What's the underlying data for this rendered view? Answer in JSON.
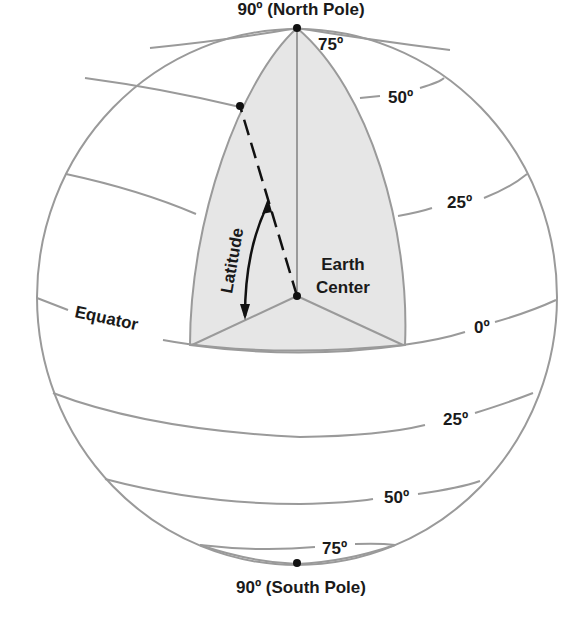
{
  "diagram": {
    "title_top": "90º (North Pole)",
    "title_bottom": "90º (South Pole)",
    "center_label_line1": "Earth",
    "center_label_line2": "Center",
    "angle_label": "Latitude",
    "equator_label": "Equator",
    "northern_latitudes": [
      "75º",
      "50º",
      "25º"
    ],
    "equator_degree": "0º",
    "southern_latitudes": [
      "25º",
      "50º",
      "75º"
    ],
    "colors": {
      "lines": "#9a9a9a",
      "wedge_fill": "#e6e6e6",
      "text": "#1a1a1a"
    }
  }
}
